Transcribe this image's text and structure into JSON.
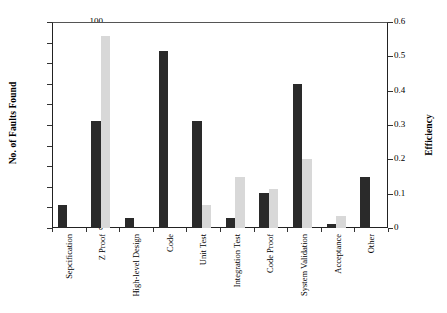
{
  "chart_data": {
    "type": "bar",
    "title": "",
    "subtitle": "",
    "xlabel": "",
    "ylabel": "No. of Faults Found",
    "y2label": "Efficiency",
    "grid": false,
    "legend": "none",
    "orientation": "vertical",
    "grouping": "grouped",
    "categories": [
      "Sepcification",
      "Z Proof",
      "High-level Design",
      "Code",
      "Unit Test",
      "Integration Test",
      "Code Proof",
      "System Validation",
      "Acceptance",
      "Other"
    ],
    "series": [
      {
        "name": "No. of Faults Found",
        "axis": "left",
        "color": "#2a2a2a",
        "values": [
          11,
          52,
          5,
          86,
          52,
          5,
          17,
          70,
          2,
          25
        ]
      },
      {
        "name": "Efficiency",
        "axis": "right",
        "color": "#d8d8d8",
        "values": [
          null,
          0.56,
          null,
          null,
          0.066,
          0.15,
          0.113,
          0.2,
          0.036,
          null
        ]
      }
    ],
    "ylim": [
      0,
      100
    ],
    "yticks": [
      0,
      10,
      20,
      30,
      40,
      50,
      60,
      70,
      80,
      90,
      100
    ],
    "y2lim": [
      0,
      0.6
    ],
    "y2ticks": [
      0,
      0.1,
      0.2,
      0.3,
      0.4,
      0.5,
      0.6
    ]
  },
  "axes": {
    "left": {
      "title": "No. of Faults Found",
      "tick_labels": [
        "100",
        "90",
        "80",
        "70",
        "60",
        "50",
        "40",
        "30",
        "20",
        "10",
        "0"
      ]
    },
    "right": {
      "title": "Efficiency",
      "tick_labels": [
        "0.6",
        "0.5",
        "0.4",
        "0.3",
        "0.2",
        "0.1",
        "0"
      ]
    },
    "categories": [
      "Sepcification",
      "Z Proof",
      "High-level Design",
      "Code",
      "Unit Test",
      "Integration Test",
      "Code Proof",
      "System Validation",
      "Acceptance",
      "Other"
    ]
  },
  "colors": {
    "dark_bar": "#2a2a2a",
    "light_bar": "#d8d8d8",
    "axis": "#222222",
    "background": "#ffffff"
  }
}
